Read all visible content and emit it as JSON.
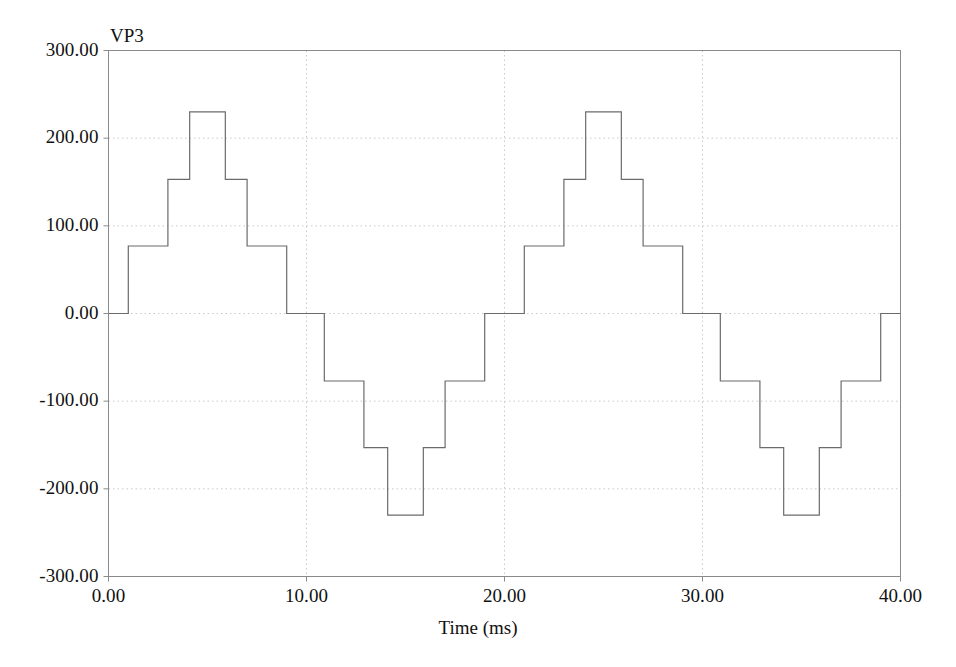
{
  "series_label": "VP3",
  "axis": {
    "x_title": "Time (ms)",
    "y_title": "",
    "x_ticks": [
      "0.00",
      "10.00",
      "20.00",
      "30.00",
      "40.00"
    ],
    "y_ticks": [
      "300.00",
      "200.00",
      "100.00",
      "0.00",
      "-100.00",
      "-200.00",
      "-300.00"
    ]
  },
  "colors": {
    "line": "#6b6b6b",
    "frame": "#8a8a8a",
    "grid": "#c9c9c9",
    "background": "#ffffff",
    "text": "#111111"
  },
  "chart_data": {
    "type": "line",
    "title": "",
    "subtitle": "",
    "xlabel": "Time (ms)",
    "ylabel": "",
    "xlim": [
      0.0,
      40.0
    ],
    "ylim": [
      -300.0,
      300.0
    ],
    "xticks": [
      0.0,
      10.0,
      20.0,
      30.0,
      40.0
    ],
    "yticks": [
      -300.0,
      -200.0,
      -100.0,
      0.0,
      100.0,
      200.0,
      300.0
    ],
    "grid": true,
    "legend": "none",
    "line_style": "step-post",
    "waveform": {
      "description": "Seven-level stepped (staircase) sine approximation, inverter phase voltage",
      "period_ms": 20.0,
      "frequency_hz": 50.0,
      "step_width_ms": 2.0,
      "levels": [
        0,
        77,
        153,
        230,
        153,
        77,
        0,
        -77,
        -153,
        -230,
        -153,
        -77
      ],
      "peak_value": 230,
      "units": "V"
    },
    "series": [
      {
        "name": "VP3",
        "x": [
          0.0,
          1.0,
          1.0,
          3.0,
          3.0,
          4.1,
          4.1,
          5.9,
          5.9,
          7.0,
          7.0,
          9.0,
          9.0,
          10.9,
          10.9,
          12.9,
          12.9,
          14.1,
          14.1,
          15.9,
          15.9,
          17.0,
          17.0,
          19.0,
          19.0,
          21.0,
          21.0,
          23.0,
          23.0,
          24.1,
          24.1,
          25.9,
          25.9,
          27.0,
          27.0,
          29.0,
          29.0,
          30.9,
          30.9,
          32.9,
          32.9,
          34.1,
          34.1,
          35.9,
          35.9,
          37.0,
          37.0,
          39.0,
          39.0,
          40.0
        ],
        "y": [
          0,
          0,
          77,
          77,
          153,
          153,
          230,
          230,
          153,
          153,
          77,
          77,
          0,
          0,
          -77,
          -77,
          -153,
          -153,
          -230,
          -230,
          -153,
          -153,
          -77,
          -77,
          0,
          0,
          77,
          77,
          153,
          153,
          230,
          230,
          153,
          153,
          77,
          77,
          0,
          0,
          -77,
          -77,
          -153,
          -153,
          -230,
          -230,
          -153,
          -153,
          -77,
          -77,
          0,
          0
        ]
      }
    ]
  }
}
